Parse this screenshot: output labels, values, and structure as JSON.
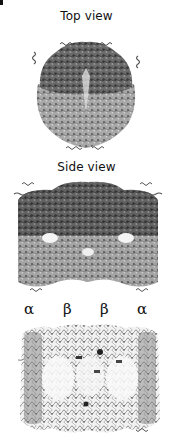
{
  "figure": {
    "panels": [
      {
        "id": "top",
        "label": "Top view"
      },
      {
        "id": "side",
        "label": "Side view"
      },
      {
        "id": "cross-section",
        "label": ""
      }
    ],
    "subunit_labels": [
      "α",
      "β",
      "β",
      "α"
    ],
    "colors": {
      "background": "#ffffff",
      "text": "#111111",
      "dense_ribbon": "#5a5a5a",
      "light_ribbon": "#9a9a9a",
      "outline_ribbon": "#444444"
    }
  }
}
